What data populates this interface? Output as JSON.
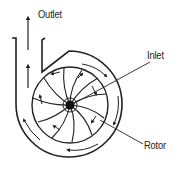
{
  "diagram": {
    "labels": {
      "outlet": "Outlet",
      "inlet": "Inlet",
      "rotor": "Rotor"
    },
    "colors": {
      "stroke": "#222222",
      "background": "#ffffff"
    },
    "blade_count": 12
  }
}
